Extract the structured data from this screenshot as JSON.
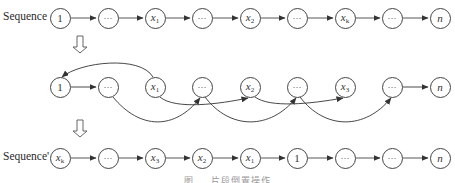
{
  "diagram": {
    "type": "sequence-reorder",
    "rows": [
      {
        "id": "original",
        "label": "Sequence",
        "nodes": [
          {
            "text": "1"
          },
          {
            "text": "···"
          },
          {
            "var": "x",
            "sub": "1"
          },
          {
            "text": "···"
          },
          {
            "var": "x",
            "sub": "2"
          },
          {
            "text": "···"
          },
          {
            "var": "x",
            "sub": "k"
          },
          {
            "text": "···"
          },
          {
            "var": "n"
          }
        ]
      },
      {
        "id": "intermediate",
        "label": "",
        "nodes": [
          {
            "text": "1"
          },
          {
            "text": "···"
          },
          {
            "var": "x",
            "sub": "1"
          },
          {
            "text": "···"
          },
          {
            "var": "x",
            "sub": "2"
          },
          {
            "text": "···"
          },
          {
            "var": "x",
            "sub": "3"
          },
          {
            "text": "···"
          },
          {
            "var": "n"
          }
        ]
      },
      {
        "id": "result",
        "label": "Sequence'",
        "nodes": [
          {
            "var": "x",
            "sub": "k"
          },
          {
            "text": "···"
          },
          {
            "var": "x",
            "sub": "3"
          },
          {
            "var": "x",
            "sub": "2"
          },
          {
            "var": "x",
            "sub": "1"
          },
          {
            "text": "1"
          },
          {
            "text": "···"
          },
          {
            "text": "···"
          },
          {
            "var": "n"
          }
        ]
      }
    ],
    "transition_arrow": "down-hollow-arrow",
    "caption": "图 … 片段倒置操作",
    "colors": {
      "stroke": "#444444",
      "text": "#333333",
      "background": "#ffffff"
    }
  }
}
